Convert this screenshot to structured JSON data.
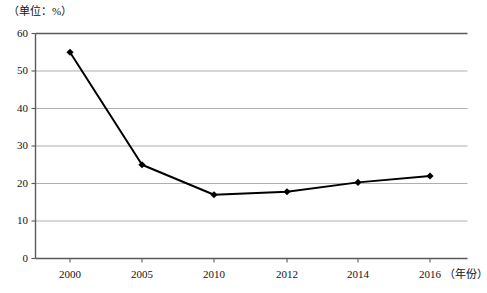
{
  "chart_data": {
    "type": "line",
    "title": "",
    "unit_note": "（单位：%）",
    "xlabel": "（年份）",
    "ylabel": "",
    "categories": [
      "2000",
      "2005",
      "2010",
      "2012",
      "2014",
      "2016"
    ],
    "x": [
      2000,
      2005,
      2010,
      2012,
      2014,
      2016
    ],
    "values": [
      55,
      25,
      17,
      17.8,
      20.3,
      22
    ],
    "series": [
      {
        "name": "",
        "values": [
          55,
          25,
          17,
          17.8,
          20.3,
          22
        ]
      }
    ],
    "ylim": [
      0,
      60
    ],
    "ytick_labels": [
      "0",
      "10",
      "20",
      "30",
      "40",
      "50",
      "60"
    ],
    "yticks": [
      0,
      10,
      20,
      30,
      40,
      50,
      60
    ],
    "xtick_labels": [
      "2000",
      "2005",
      "2010",
      "2012",
      "2014",
      "2016"
    ],
    "grid": true,
    "grid_axis": "y",
    "legend": false,
    "legend_position": "none",
    "marker": "diamond",
    "line_color": "#000000",
    "marker_color": "#000000",
    "grid_color": "#a6a6a6",
    "axis_color": "#7f7f7f",
    "background": "#ffffff"
  },
  "axis_titles": {
    "unit": "（单位：%）",
    "x_name": "（年份）"
  },
  "ticks": {
    "y": [
      {
        "label": "60",
        "value": 60
      },
      {
        "label": "50",
        "value": 50
      },
      {
        "label": "40",
        "value": 40
      },
      {
        "label": "30",
        "value": 30
      },
      {
        "label": "20",
        "value": 20
      },
      {
        "label": "10",
        "value": 10
      },
      {
        "label": "0",
        "value": 0
      }
    ],
    "x": [
      {
        "label": "2000",
        "value": 2000
      },
      {
        "label": "2005",
        "value": 2005
      },
      {
        "label": "2010",
        "value": 2010
      },
      {
        "label": "2012",
        "value": 2012
      },
      {
        "label": "2014",
        "value": 2014
      },
      {
        "label": "2016",
        "value": 2016
      }
    ]
  }
}
